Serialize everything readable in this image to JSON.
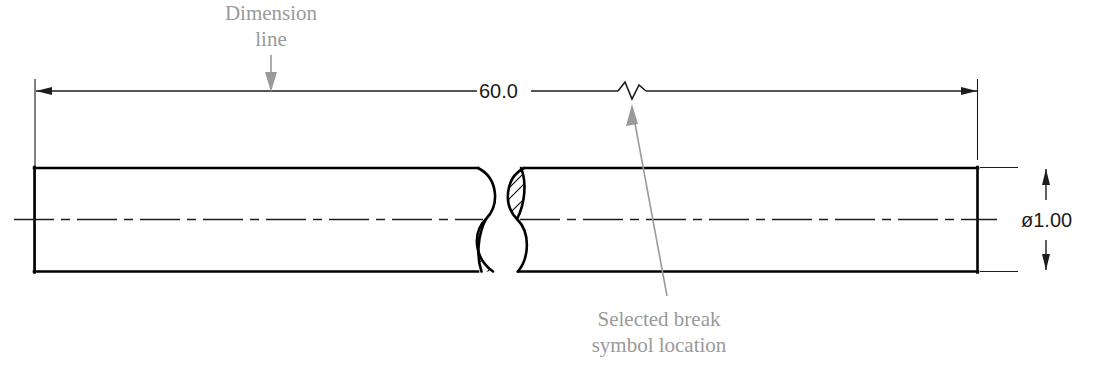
{
  "drawing": {
    "title": "Cylindrical break symbol dimensioning example",
    "background_color": "#ffffff",
    "object_line_color": "#000000",
    "dimension_color": "#1c1c1c",
    "annotation_color": "#9a9a9a"
  },
  "annotations": [
    {
      "name": "dimension-line-callout",
      "line1": "Dimension",
      "line2": "line",
      "leader": "arrow pointing down to dimension line"
    },
    {
      "name": "break-symbol-callout",
      "line1": "Selected break",
      "line2": "symbol location",
      "leader": "arrow pointing up to zigzag break on dimension line"
    }
  ],
  "dimensions": [
    {
      "name": "overall-length",
      "value": "60.0",
      "orientation": "horizontal",
      "note": "dimension line interrupted by zigzag break symbol"
    },
    {
      "name": "diameter",
      "value": "ø1.00",
      "orientation": "vertical",
      "symbol": "diameter-symbol"
    }
  ],
  "part": {
    "name": "round-shaft",
    "feature": "conventional S-break (cylindrical break) with section hatching",
    "centerline": "long-dash short-dash"
  }
}
